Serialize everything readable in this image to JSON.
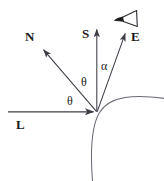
{
  "figure": {
    "stroke_color": "#3c3c46",
    "label_color": "#1a1a1a",
    "background": "#ffffff"
  },
  "labels": {
    "normal": "N",
    "surface_normal_s": "S",
    "eye": "E",
    "light": "L",
    "theta_left": "θ",
    "theta_right": "θ",
    "alpha": "α"
  },
  "icons": {
    "viewer": "eye-icon"
  },
  "geometry": {
    "vertex": {
      "x": 97,
      "y": 112
    },
    "vectors": [
      {
        "name": "N",
        "tip_x": 42,
        "tip_y": 48
      },
      {
        "name": "S",
        "tip_x": 97,
        "tip_y": 28
      },
      {
        "name": "E",
        "tip_x": 126,
        "tip_y": 32
      },
      {
        "name": "L",
        "tail_x": 8,
        "tail_y": 112,
        "tip_x": 95,
        "tip_y": 112
      }
    ],
    "surface_arc": "curved surface through vertex"
  }
}
